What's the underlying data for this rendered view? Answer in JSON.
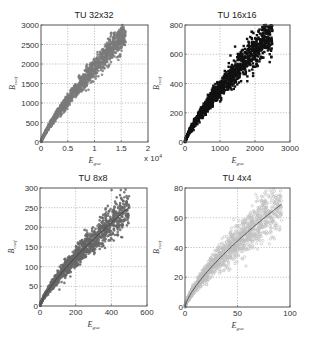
{
  "figure": {
    "width": 310,
    "height": 344,
    "background": "#ffffff"
  },
  "chart_data": [
    {
      "type": "scatter",
      "title": "TU 32x32",
      "xlabel": "E",
      "xlabel_sub": "gsa",
      "ylabel": "B",
      "ylabel_sub": "coef",
      "xlim": [
        0,
        2
      ],
      "ylim": [
        0,
        3000
      ],
      "x_multiplier_label": "x 10^4",
      "xticks": [
        0,
        0.5,
        1,
        1.5,
        2
      ],
      "xticklabels": [
        "0",
        "0.5",
        "1",
        "1.5",
        "2"
      ],
      "yticks": [
        0,
        500,
        1000,
        1500,
        2000,
        2500,
        3000
      ],
      "yticklabels": [
        "0",
        "500",
        "1000",
        "1500",
        "2000",
        "2500",
        "3000"
      ],
      "grid": true,
      "marker_color": "#7a7a7a",
      "fit_line": false,
      "trend": {
        "coef": 1900,
        "exp": 0.82,
        "x_max": 1.58,
        "spread": 0.07
      },
      "box": {
        "x": 41,
        "y": 25,
        "w": 107,
        "h": 117
      },
      "approx_points": [
        [
          0,
          0
        ],
        [
          0.25,
          600
        ],
        [
          0.5,
          1050
        ],
        [
          0.75,
          1450
        ],
        [
          1.0,
          1800
        ],
        [
          1.25,
          2100
        ],
        [
          1.55,
          2450
        ]
      ]
    },
    {
      "type": "scatter",
      "title": "TU 16x16",
      "xlabel": "E",
      "xlabel_sub": "gsa",
      "ylabel": "B",
      "ylabel_sub": "coef",
      "xlim": [
        0,
        3000
      ],
      "ylim": [
        0,
        800
      ],
      "xticks": [
        0,
        1000,
        2000,
        3000
      ],
      "xticklabels": [
        "0",
        "1000",
        "2000",
        "3000"
      ],
      "yticks": [
        0,
        200,
        400,
        600,
        800
      ],
      "yticklabels": [
        "0",
        "200",
        "400",
        "600",
        "800"
      ],
      "grid": true,
      "marker_color": "#111111",
      "fit_line": false,
      "trend": {
        "coef": 1.55,
        "exp": 0.79,
        "x_max": 2500,
        "spread": 0.09
      },
      "box": {
        "x": 185,
        "y": 25,
        "w": 105,
        "h": 117
      },
      "approx_points": [
        [
          0,
          0
        ],
        [
          500,
          210
        ],
        [
          1000,
          360
        ],
        [
          1500,
          490
        ],
        [
          2000,
          600
        ],
        [
          2450,
          710
        ]
      ]
    },
    {
      "type": "scatter",
      "title": "TU 8x8",
      "xlabel": "E",
      "xlabel_sub": "gsa",
      "ylabel": "B",
      "ylabel_sub": "coef",
      "xlim": [
        0,
        600
      ],
      "ylim": [
        0,
        300
      ],
      "xticks": [
        0,
        200,
        400,
        600
      ],
      "xticklabels": [
        "0",
        "200",
        "400",
        "600"
      ],
      "yticks": [
        0,
        50,
        100,
        150,
        200,
        250,
        300
      ],
      "yticklabels": [
        "0",
        "50",
        "100",
        "150",
        "200",
        "250",
        "300"
      ],
      "grid": true,
      "marker_color": "#666666",
      "fit_line": true,
      "fit_color": "#444444",
      "trend": {
        "coef": 2.1,
        "exp": 0.77,
        "x_max": 500,
        "spread": 0.1
      },
      "box": {
        "x": 40,
        "y": 188,
        "w": 107,
        "h": 118
      },
      "approx_points": [
        [
          0,
          0
        ],
        [
          100,
          75
        ],
        [
          200,
          125
        ],
        [
          300,
          170
        ],
        [
          400,
          210
        ],
        [
          500,
          245
        ]
      ]
    },
    {
      "type": "scatter",
      "title": "TU 4x4",
      "xlabel": "E",
      "xlabel_sub": "gsa",
      "ylabel": "B",
      "ylabel_sub": "coef",
      "xlim": [
        0,
        100
      ],
      "ylim": [
        0,
        80
      ],
      "xticks": [
        0,
        50,
        100
      ],
      "xticklabels": [
        "0",
        "50",
        "100"
      ],
      "yticks": [
        0,
        20,
        40,
        60,
        80
      ],
      "yticklabels": [
        "0",
        "20",
        "40",
        "60",
        "80"
      ],
      "grid": true,
      "marker_color": "#bdbdbd",
      "fit_line": true,
      "fit_color": "#555555",
      "trend": {
        "coef": 2.55,
        "exp": 0.73,
        "x_max": 92,
        "spread": 0.13
      },
      "box": {
        "x": 185,
        "y": 188,
        "w": 105,
        "h": 119
      },
      "approx_points": [
        [
          0,
          0
        ],
        [
          10,
          15
        ],
        [
          25,
          29
        ],
        [
          50,
          46
        ],
        [
          75,
          59
        ],
        [
          92,
          68
        ]
      ]
    }
  ]
}
